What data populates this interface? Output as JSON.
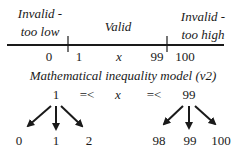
{
  "number_line": {
    "regions": [
      {
        "line1": "Invalid -",
        "line2": "too low"
      },
      {
        "line1": "Valid"
      },
      {
        "line1": "Invalid -",
        "line2": "too high"
      }
    ],
    "ticks_below": [
      "0",
      "1",
      "x",
      "99",
      "100"
    ]
  },
  "caption": "Mathematical inequality model (v2)",
  "inequality": {
    "lower": "1",
    "op1": "=<",
    "var": "x",
    "op2": "=<",
    "upper": "99"
  },
  "lower_boundary_values": [
    "0",
    "1",
    "2"
  ],
  "upper_boundary_values": [
    "98",
    "99",
    "100"
  ],
  "colors": {
    "ink": "#1a1a1a",
    "background": "#ffffff"
  }
}
